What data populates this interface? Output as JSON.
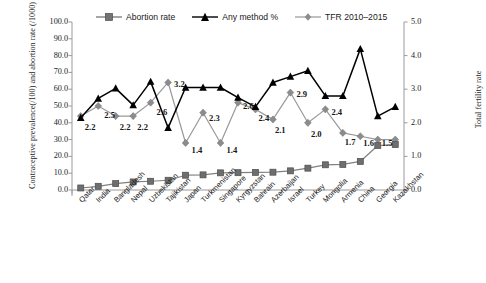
{
  "chart_data": {
    "type": "line",
    "title": "",
    "categories": [
      "Qatar",
      "India",
      "Bangladesh",
      "Nepal",
      "Uzbekistan",
      "Tajikistan",
      "Japan",
      "Turkmenistan",
      "Singapore",
      "Kyrgyzstan",
      "Bahrain",
      "Azerbaijan",
      "Israel",
      "Turkey",
      "Mongolia",
      "Armenia",
      "China",
      "Georgia",
      "Kazakhstan"
    ],
    "series": [
      {
        "name": "Abortion rate",
        "axis": "left",
        "color": "#808080",
        "marker": "square",
        "values": [
          1.2,
          2.2,
          3.8,
          4.8,
          5.2,
          5.8,
          8.8,
          9.0,
          10.2,
          10.3,
          10.5,
          10.6,
          11.4,
          13.0,
          15.0,
          15.2,
          17.0,
          26.5,
          27.0
        ]
      },
      {
        "name": "Any method %",
        "axis": "left",
        "color": "#000000",
        "marker": "triangle",
        "values": [
          43.0,
          54.5,
          60.5,
          50.5,
          64.5,
          37.0,
          61.0,
          61.0,
          61.0,
          55.0,
          49.5,
          64.0,
          67.5,
          71.0,
          56.0,
          56.0,
          84.0,
          44.0,
          49.5
        ]
      },
      {
        "name": "TFR 2010–2015",
        "axis": "right",
        "color": "#999999",
        "marker": "diamond",
        "values": [
          2.2,
          2.5,
          2.2,
          2.2,
          2.6,
          3.2,
          1.4,
          2.3,
          1.4,
          2.6,
          2.4,
          2.1,
          2.9,
          2.0,
          2.4,
          1.7,
          1.6,
          1.5,
          1.5
        ]
      }
    ],
    "data_labels": {
      "series": "TFR 2010–2015",
      "values": [
        "2.2",
        "2.5",
        "2.2",
        "2.2",
        "2.6",
        "3.2",
        "1.4",
        "2.3",
        "1.4",
        "2.6",
        "2.4",
        "2.1",
        "2.9",
        "2.0",
        "2.4",
        "1.7",
        "1.6",
        "1.5"
      ]
    },
    "ylabel": "Contraceptive prevalence(/100) and abortion rate (/1000)",
    "ylabel_right": "Total fertility rate",
    "xlabel": "",
    "ylim": [
      0,
      100
    ],
    "ylim_right": [
      0,
      5
    ],
    "yticks": [
      "0.0",
      "10.0",
      "20.0",
      "30.0",
      "40.0",
      "50.0",
      "60.0",
      "70.0",
      "80.0",
      "90.0",
      "100.0"
    ],
    "yticks_right": [
      "0.0",
      "1.0",
      "2.0",
      "3.0",
      "4.0",
      "5.0"
    ],
    "grid": false,
    "legend_position": "top"
  },
  "legend": {
    "items": [
      {
        "label": "Abortion rate",
        "marker": "square-marker",
        "color": "#808080"
      },
      {
        "label": "Any method %",
        "marker": "triangle-marker",
        "color": "#000000"
      },
      {
        "label": "TFR 2010–2015",
        "marker": "diamond-marker",
        "color": "#999999"
      }
    ]
  },
  "axes": {
    "left_title": "Contraceptive prevalence(/100) and abortion rate (/1000)",
    "right_title": "Total fertility rate"
  }
}
